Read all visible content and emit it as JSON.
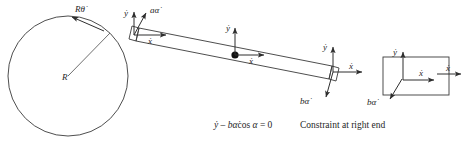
{
  "figure": {
    "background_color": "#ffffff",
    "line_color": "#3a3a3a",
    "text_color": "#262626"
  },
  "disk": {
    "name": "circular-disk",
    "radius_label": "R",
    "center": {
      "x": 68,
      "y": 76
    },
    "radius_px": 60,
    "rim_velocity_label": "Rθ̇",
    "rim_velocity_label_plain": "R theta-dot"
  },
  "rod": {
    "name": "slender-rod",
    "left_end": {
      "vertical_velocity_label": "ẏ",
      "vertical_velocity_plain": "y-dot",
      "rotational_velocity_label": "aα̇",
      "rotational_velocity_plain": "a alpha-dot",
      "axial_velocity_label": "ẋ",
      "axial_velocity_plain": "x-dot"
    },
    "center": {
      "vertical_velocity_label": "ẏ",
      "axial_velocity_label": "ẋ",
      "marker": "mass-center-dot"
    },
    "right_end": {
      "vertical_velocity_label": "ẏ",
      "axial_velocity_label": "ẋ",
      "rotational_velocity_label": "bα̇",
      "rotational_velocity_plain": "b alpha-dot"
    }
  },
  "right_block": {
    "name": "right-end-block",
    "vertical_velocity_label": "ẏ",
    "inner_axial_velocity_label": "ẋ",
    "outer_axial_velocity_label": "ẋ",
    "rotational_velocity_label": "bα̇"
  },
  "constraint": {
    "equation_parts": {
      "ydot": "ẏ",
      "minus": " – ",
      "b": "b",
      "alphadot": "α̇",
      "cos": "cos ",
      "alpha": "α",
      "equals": " = 0"
    },
    "equation_full": "ẏ – bα̇cos α = 0",
    "caption": "Constraint at right end"
  }
}
